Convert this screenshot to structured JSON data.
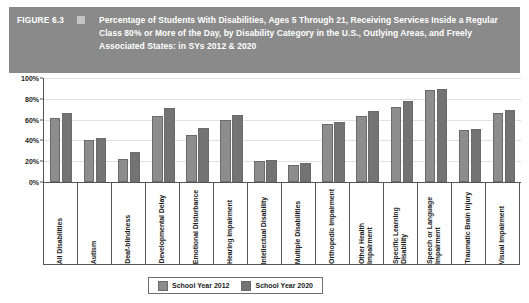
{
  "header": {
    "figure_label": "FIGURE 6.3",
    "marker_icon": "square-marker-icon",
    "title": "Percentage of Students With Disabilities, Ages 5 Through 21, Receiving Services Inside a Regular Class 80% or More of the Day, by Disability Category in the U.S., Outlying Areas, and Freely Associated States: in SYs 2012 & 2020",
    "banner_color": "#8a8a8a"
  },
  "legend": {
    "items": [
      {
        "label": "School Year 2012",
        "color": "#8d8d8d"
      },
      {
        "label": "School Year 2020",
        "color": "#737373"
      }
    ]
  },
  "axis": {
    "y_ticks": [
      "100%",
      "80%",
      "60%",
      "40%",
      "20%",
      "0%"
    ]
  },
  "chart_data": {
    "type": "bar",
    "title": "Percentage of Students With Disabilities, Ages 5 Through 21, Receiving Services Inside a Regular Class 80% or More of the Day, by Disability Category in the U.S., Outlying Areas, and Freely Associated States: in SYs 2012 & 2020",
    "xlabel": "",
    "ylabel": "",
    "ylim": [
      0,
      100
    ],
    "yticks": [
      0,
      20,
      40,
      60,
      80,
      100
    ],
    "ytick_labels": [
      "0%",
      "20%",
      "40%",
      "60%",
      "80%",
      "100%"
    ],
    "grid": true,
    "legend_position": "bottom",
    "categories": [
      "All Disabilities",
      "Autism",
      "Deaf-blindness",
      "Developmental Delay",
      "Emotional Disturbance",
      "Hearing Impairment",
      "Intellectual Disability",
      "Multiple Disabilities",
      "Orthopedic Impairment",
      "Other Health Impairment",
      "Specific Learning Disability",
      "Speech or Language Impairment",
      "Traumatic Brain Injury",
      "Visual Impairment"
    ],
    "series": [
      {
        "name": "School Year 2012",
        "color": "#8d8d8d",
        "values": [
          62,
          40,
          22,
          63,
          45,
          60,
          20,
          16,
          56,
          63,
          72,
          88,
          50,
          66
        ]
      },
      {
        "name": "School Year 2020",
        "color": "#737373",
        "values": [
          66,
          42,
          29,
          71,
          52,
          64,
          21,
          18,
          58,
          68,
          78,
          89,
          51,
          69
        ]
      }
    ]
  }
}
